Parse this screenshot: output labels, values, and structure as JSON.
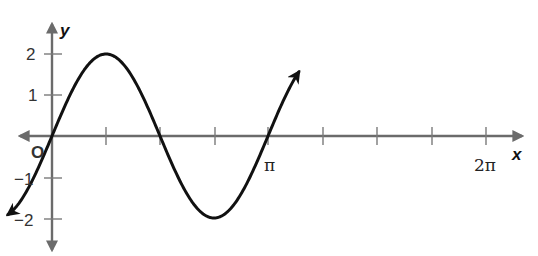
{
  "chart_data": {
    "type": "line",
    "title": "",
    "function": "y = 2 sin x",
    "xlabel": "x",
    "ylabel": "y",
    "origin_label": "O",
    "x_ticks_rad": [
      0.7854,
      1.5708,
      2.3562,
      3.1416,
      3.927,
      4.7124,
      5.4978,
      6.2832
    ],
    "x_tick_labels": [
      {
        "value": 3.1416,
        "label": "π"
      },
      {
        "value": 6.2832,
        "label": "2π"
      }
    ],
    "y_ticks": [
      2,
      1,
      -1,
      -2
    ],
    "y_tick_labels": [
      "2",
      "1",
      "−1",
      "−2"
    ],
    "xlim": [
      -1.3,
      7.3
    ],
    "ylim": [
      -2.5,
      2.6
    ],
    "grid": false,
    "series": [
      {
        "name": "2 sin x",
        "x": [
          -1.28,
          0,
          0.7854,
          1.5708,
          2.3562,
          3.1416,
          3.927,
          4.7124,
          5.4978,
          6.2832,
          7.0686,
          7.18
        ],
        "y": [
          -1.92,
          0,
          1.414,
          2,
          1.414,
          0,
          -1.414,
          -2,
          -1.414,
          0,
          1.414,
          1.55
        ]
      }
    ],
    "annotations": [
      "arrow at both curve ends",
      "arrow heads on both axes"
    ],
    "color": "#111111"
  },
  "labels": {
    "y_axis": "y",
    "x_axis": "x",
    "origin": "O",
    "y2": "2",
    "y1": "1",
    "ym1": "−1",
    "ym2": "−2",
    "pi": "π",
    "two_pi": "2π"
  }
}
